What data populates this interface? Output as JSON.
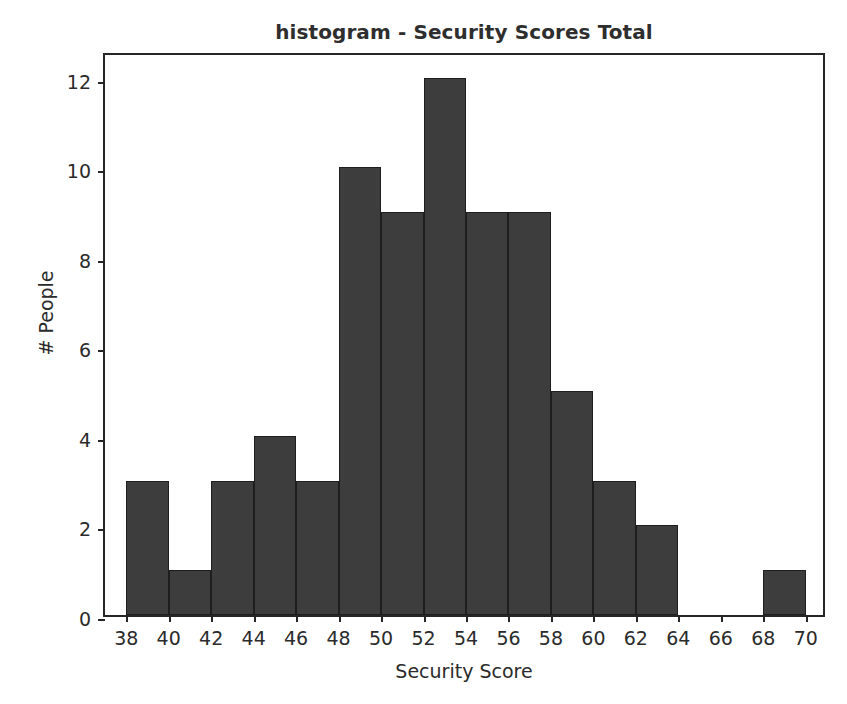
{
  "chart_data": {
    "type": "bar",
    "title": "histogram - Security Scores Total",
    "xlabel": "Security Score",
    "ylabel": "# People",
    "grid": false,
    "legend": null,
    "xlim": [
      37,
      71
    ],
    "ylim": [
      0,
      12.6
    ],
    "bin_width": 2,
    "bin_edges": [
      38,
      40,
      42,
      44,
      46,
      48,
      50,
      52,
      54,
      56,
      58,
      60,
      62,
      64,
      66,
      68,
      70
    ],
    "categories": [
      "38-40",
      "40-42",
      "42-44",
      "44-46",
      "46-48",
      "48-50",
      "50-52",
      "52-54",
      "54-56",
      "56-58",
      "58-60",
      "60-62",
      "62-64",
      "64-66",
      "66-68",
      "68-70"
    ],
    "values": [
      3,
      1,
      3,
      4,
      3,
      10,
      9,
      12,
      9,
      9,
      5,
      3,
      2,
      0,
      0,
      1
    ],
    "xticks": [
      38,
      40,
      42,
      44,
      46,
      48,
      50,
      52,
      54,
      56,
      58,
      60,
      62,
      64,
      66,
      68,
      70
    ],
    "xtick_labels": [
      "38",
      "40",
      "42",
      "44",
      "46",
      "48",
      "50",
      "52",
      "54",
      "56",
      "58",
      "60",
      "62",
      "64",
      "66",
      "68",
      "70"
    ],
    "yticks": [
      0,
      2,
      4,
      6,
      8,
      10,
      12
    ],
    "ytick_labels": [
      "0",
      "2",
      "4",
      "6",
      "8",
      "10",
      "12"
    ],
    "bar_color": "#3d3d3d",
    "bar_edge_color": "#1e1e1e",
    "axis_color": "#262626",
    "background_color": "#ffffff",
    "total_count": 65
  }
}
